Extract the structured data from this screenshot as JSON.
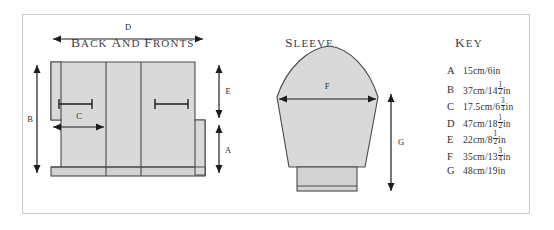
{
  "panel": {
    "sections": {
      "back_and_fronts_heading": "BACK AND FRONTS",
      "sleeve_heading": "SLEEVE",
      "key_heading": "KEY"
    }
  },
  "diagram_labels": {
    "back": {
      "a": "A",
      "b": "B",
      "c": "C",
      "d": "D",
      "e": "E"
    },
    "sleeve": {
      "f": "F",
      "g": "G"
    }
  },
  "key": {
    "items": [
      {
        "letter": "A",
        "metric": "15cm/",
        "inches": "6",
        "frac_num": "",
        "frac_den": "",
        "unit": "in"
      },
      {
        "letter": "B",
        "metric": "37cm/",
        "inches": "14",
        "frac_num": "1",
        "frac_den": "2",
        "unit": "in"
      },
      {
        "letter": "C",
        "metric": "17.5cm/",
        "inches": "6",
        "frac_num": "3",
        "frac_den": "4",
        "unit": "in"
      },
      {
        "letter": "D",
        "metric": "47cm/",
        "inches": "18",
        "frac_num": "1",
        "frac_den": "2",
        "unit": "in"
      },
      {
        "letter": "E",
        "metric": "22cm/",
        "inches": "8",
        "frac_num": "1",
        "frac_den": "2",
        "unit": "in"
      },
      {
        "letter": "F",
        "metric": "35cm/",
        "inches": "13",
        "frac_num": "3",
        "frac_den": "4",
        "unit": "in"
      },
      {
        "letter": "G",
        "metric": "48cm/",
        "inches": "19",
        "frac_num": "",
        "frac_den": "",
        "unit": "in"
      }
    ]
  },
  "colors": {
    "piece_fill": "#d9d9d9",
    "outline": "#4a4a4a",
    "border": "#c9c9c9",
    "text": "#2f2f2f"
  }
}
